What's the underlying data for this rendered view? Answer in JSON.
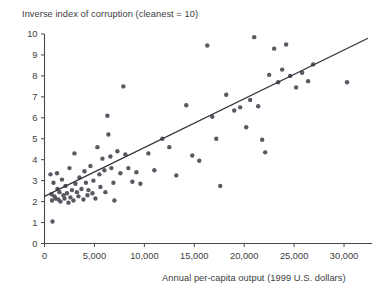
{
  "chart_data": {
    "type": "scatter",
    "title": "Inverse index of corruption (cleanest = 10)",
    "xlabel": "Annual per-capita output (1999 U.S. dollars)",
    "ylabel": "Inverse index of corruption (cleanest = 10)",
    "xlim": [
      0,
      32400
    ],
    "ylim": [
      0,
      10
    ],
    "grid": false,
    "legend": null,
    "xticks": [
      0,
      5000,
      10000,
      15000,
      20000,
      25000,
      30000
    ],
    "xticklabels": [
      "0",
      "5,000",
      "10,000",
      "15,000",
      "20,000",
      "25,000",
      "30,000"
    ],
    "yticks": [
      0,
      1,
      2,
      3,
      4,
      5,
      6,
      7,
      8,
      9,
      10
    ],
    "yticklabels": [
      "0",
      "1",
      "2",
      "3",
      "4",
      "5",
      "6",
      "7",
      "8",
      "9",
      "10"
    ],
    "marker_color": "#595963",
    "marker_size": 4.4,
    "trendline": {
      "type": "linear",
      "color": "#33333a",
      "x_start": 0,
      "y_start": 2.25,
      "x_end": 32400,
      "y_end": 9.8
    },
    "points": [
      {
        "x": 600,
        "y": 3.3
      },
      {
        "x": 700,
        "y": 2.35
      },
      {
        "x": 750,
        "y": 2.05
      },
      {
        "x": 800,
        "y": 1.05
      },
      {
        "x": 900,
        "y": 2.9
      },
      {
        "x": 1000,
        "y": 2.25
      },
      {
        "x": 1100,
        "y": 2.15
      },
      {
        "x": 1250,
        "y": 3.35
      },
      {
        "x": 1300,
        "y": 2.6
      },
      {
        "x": 1400,
        "y": 2.1
      },
      {
        "x": 1500,
        "y": 2.45
      },
      {
        "x": 1600,
        "y": 2.0
      },
      {
        "x": 1750,
        "y": 3.05
      },
      {
        "x": 1900,
        "y": 2.3
      },
      {
        "x": 2000,
        "y": 2.15
      },
      {
        "x": 2100,
        "y": 2.75
      },
      {
        "x": 2250,
        "y": 2.4
      },
      {
        "x": 2400,
        "y": 1.95
      },
      {
        "x": 2500,
        "y": 3.6
      },
      {
        "x": 2600,
        "y": 2.2
      },
      {
        "x": 2750,
        "y": 2.55
      },
      {
        "x": 2900,
        "y": 2.05
      },
      {
        "x": 3000,
        "y": 4.3
      },
      {
        "x": 3100,
        "y": 2.85
      },
      {
        "x": 3250,
        "y": 2.45
      },
      {
        "x": 3400,
        "y": 2.25
      },
      {
        "x": 3500,
        "y": 3.15
      },
      {
        "x": 3700,
        "y": 2.6
      },
      {
        "x": 3900,
        "y": 2.1
      },
      {
        "x": 4000,
        "y": 3.45
      },
      {
        "x": 4150,
        "y": 2.9
      },
      {
        "x": 4300,
        "y": 2.3
      },
      {
        "x": 4400,
        "y": 2.55
      },
      {
        "x": 4600,
        "y": 3.7
      },
      {
        "x": 4800,
        "y": 2.4
      },
      {
        "x": 4900,
        "y": 3.0
      },
      {
        "x": 5100,
        "y": 2.15
      },
      {
        "x": 5300,
        "y": 4.6
      },
      {
        "x": 5500,
        "y": 3.3
      },
      {
        "x": 5600,
        "y": 2.7
      },
      {
        "x": 5800,
        "y": 4.05
      },
      {
        "x": 6000,
        "y": 3.5
      },
      {
        "x": 6100,
        "y": 2.45
      },
      {
        "x": 6300,
        "y": 6.1
      },
      {
        "x": 6400,
        "y": 5.2
      },
      {
        "x": 6600,
        "y": 4.15
      },
      {
        "x": 6700,
        "y": 3.6
      },
      {
        "x": 6900,
        "y": 2.9
      },
      {
        "x": 7000,
        "y": 2.05
      },
      {
        "x": 7300,
        "y": 4.4
      },
      {
        "x": 7600,
        "y": 3.35
      },
      {
        "x": 7900,
        "y": 7.5
      },
      {
        "x": 8100,
        "y": 4.25
      },
      {
        "x": 8400,
        "y": 3.6
      },
      {
        "x": 8800,
        "y": 2.95
      },
      {
        "x": 9200,
        "y": 3.4
      },
      {
        "x": 9600,
        "y": 2.85
      },
      {
        "x": 10400,
        "y": 4.3
      },
      {
        "x": 11000,
        "y": 3.5
      },
      {
        "x": 11800,
        "y": 5.0
      },
      {
        "x": 12500,
        "y": 4.6
      },
      {
        "x": 13200,
        "y": 3.25
      },
      {
        "x": 14200,
        "y": 6.6
      },
      {
        "x": 14800,
        "y": 4.2
      },
      {
        "x": 15500,
        "y": 3.95
      },
      {
        "x": 16300,
        "y": 9.45
      },
      {
        "x": 16800,
        "y": 6.05
      },
      {
        "x": 17200,
        "y": 5.0
      },
      {
        "x": 17600,
        "y": 2.75
      },
      {
        "x": 18200,
        "y": 7.1
      },
      {
        "x": 19000,
        "y": 6.35
      },
      {
        "x": 19600,
        "y": 6.5
      },
      {
        "x": 20200,
        "y": 5.55
      },
      {
        "x": 20600,
        "y": 6.85
      },
      {
        "x": 21000,
        "y": 9.85
      },
      {
        "x": 21400,
        "y": 6.55
      },
      {
        "x": 21800,
        "y": 4.95
      },
      {
        "x": 22100,
        "y": 4.35
      },
      {
        "x": 22500,
        "y": 8.05
      },
      {
        "x": 23000,
        "y": 9.3
      },
      {
        "x": 23400,
        "y": 7.7
      },
      {
        "x": 23800,
        "y": 8.3
      },
      {
        "x": 24200,
        "y": 9.5
      },
      {
        "x": 24600,
        "y": 8.0
      },
      {
        "x": 25200,
        "y": 7.45
      },
      {
        "x": 25800,
        "y": 8.15
      },
      {
        "x": 26400,
        "y": 7.75
      },
      {
        "x": 26900,
        "y": 8.55
      },
      {
        "x": 30300,
        "y": 7.7
      }
    ]
  }
}
